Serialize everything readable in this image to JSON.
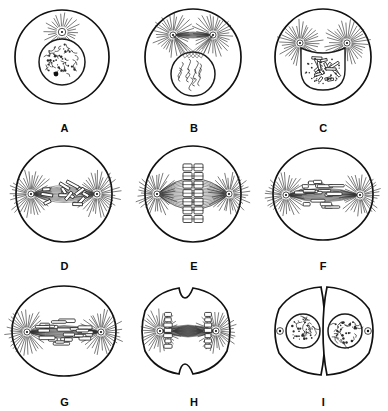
{
  "figure": {
    "panel_count": 9,
    "columns": 3,
    "rows": 3,
    "background_color": "#ffffff",
    "ink_color": "#111111",
    "style": "black-and-white line drawing"
  },
  "panels": [
    {
      "label": "A",
      "stage": "early prophase",
      "description": "Round cell with a single intact nucleus containing dense granular chromatin, one dark nucleolus, and a single aster with radiating rays sitting on top of the nucleus.",
      "cell_shape": "circle",
      "aster_count": 1,
      "nucleus": "intact-granular",
      "chromosomes_visible": false,
      "furrow": false
    },
    {
      "label": "B",
      "stage": "prophase",
      "description": "Two asters have separated and lie above the nucleus, connected by fibers; the nucleus shows coiled thread-like chromosomes inside an intact envelope.",
      "cell_shape": "circle",
      "aster_count": 2,
      "nucleus": "intact-coiled-threads",
      "chromosomes_visible": true,
      "furrow": false
    },
    {
      "label": "C",
      "stage": "late prophase",
      "description": "Asters move toward opposite sides as the nuclear envelope breaks down; condensed rod-shaped chromosomes lie in a stippled nuclear area.",
      "cell_shape": "circle",
      "aster_count": 2,
      "nucleus": "breaking-down",
      "chromosomes_visible": true,
      "furrow": false
    },
    {
      "label": "D",
      "stage": "prometaphase",
      "description": "Asters at opposite poles on the cell equator; scattered condensed chromosomes are being captured by spindle fibers in the central region.",
      "cell_shape": "circle",
      "aster_count": 2,
      "nucleus": "dispersed",
      "chromosomes_visible": true,
      "furrow": false
    },
    {
      "label": "E",
      "stage": "metaphase",
      "description": "A lens-shaped spindle spans the two poles and chromosomes are aligned in a single column at the metaphase plate in the middle of the cell.",
      "cell_shape": "circle",
      "aster_count": 2,
      "nucleus": "absent",
      "chromosomes_visible": true,
      "furrow": false
    },
    {
      "label": "F",
      "stage": "early anaphase",
      "description": "Sister chromatids have split into two groups that are beginning to move apart toward the poles through a broad barrel-shaped spindle.",
      "cell_shape": "wide-ellipse",
      "aster_count": 2,
      "nucleus": "absent",
      "chromosomes_visible": true,
      "furrow": false
    },
    {
      "label": "G",
      "stage": "late anaphase",
      "description": "The cell is elongating; the two chromosome sets have moved close to the asters and interzonal fibers stretch between them.",
      "cell_shape": "wide-ellipse",
      "aster_count": 2,
      "nucleus": "absent",
      "chromosomes_visible": true,
      "furrow": false
    },
    {
      "label": "H",
      "stage": "telophase / cytokinesis",
      "description": "Chromosome masses sit at each pole beside the asters and a cleavage furrow indents the cell at the top and bottom of the equator.",
      "cell_shape": "furrowed",
      "aster_count": 2,
      "nucleus": "reforming",
      "chromosomes_visible": true,
      "furrow": true
    },
    {
      "label": "I",
      "stage": "daughter cells",
      "description": "Two fully separated daughter cells, each with a reformed round nucleus filled with granular chromatin and a small centriole pair beside it.",
      "cell_shape": "two-daughter-cells",
      "aster_count": 0,
      "nucleus": "two-reformed",
      "chromosomes_visible": false,
      "furrow": true
    }
  ],
  "legend": {
    "sequence": "A B C D E F G H I",
    "reading_order": "left to right, top to bottom"
  }
}
